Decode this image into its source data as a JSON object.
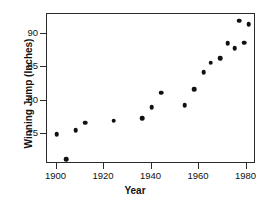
{
  "chart_data": {
    "type": "scatter",
    "title": "",
    "xlabel": "Year",
    "ylabel": "Winning Jump (Inches)",
    "xlim": [
      1896,
      1984
    ],
    "ylim": [
      70.5,
      93.0
    ],
    "xticks": [
      1900,
      1920,
      1940,
      1960,
      1980
    ],
    "xticklabels": [
      "1900",
      "1920",
      "1940",
      "1960",
      "1980"
    ],
    "yticks": [
      75,
      80,
      85,
      90
    ],
    "yticklabels": [
      "75",
      "80",
      "85",
      "90"
    ],
    "grid": false,
    "legend": null,
    "marker": "filled-circle",
    "marker_color": "#111111",
    "points": [
      {
        "x": 1900,
        "y": 75.0
      },
      {
        "x": 1904,
        "y": 71.2
      },
      {
        "x": 1908,
        "y": 75.6
      },
      {
        "x": 1912,
        "y": 76.7
      },
      {
        "x": 1924,
        "y": 77.0
      },
      {
        "x": 1936,
        "y": 77.4
      },
      {
        "x": 1940,
        "y": 79.0
      },
      {
        "x": 1944,
        "y": 81.2
      },
      {
        "x": 1954,
        "y": 79.3
      },
      {
        "x": 1958,
        "y": 81.7
      },
      {
        "x": 1962,
        "y": 84.3
      },
      {
        "x": 1965,
        "y": 85.7
      },
      {
        "x": 1969,
        "y": 86.4
      },
      {
        "x": 1972,
        "y": 88.6
      },
      {
        "x": 1975,
        "y": 87.9
      },
      {
        "x": 1977,
        "y": 92.0
      },
      {
        "x": 1979,
        "y": 88.7
      },
      {
        "x": 1981,
        "y": 91.5
      }
    ]
  }
}
